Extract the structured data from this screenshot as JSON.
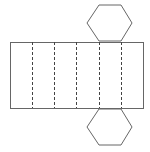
{
  "diagram": {
    "stroke_color": "#666666",
    "background": "#ffffff",
    "rectangle": {
      "x": 10,
      "y": 42,
      "width": 133,
      "height": 66
    },
    "fold_lines_x": [
      32,
      54,
      76,
      99,
      121
    ],
    "top_hexagon": "99,41 121,41 132,23 121,5 99,5 87,23",
    "bottom_hexagon": "99,109 121,109 132,127 121,145 99,145 87,127"
  }
}
